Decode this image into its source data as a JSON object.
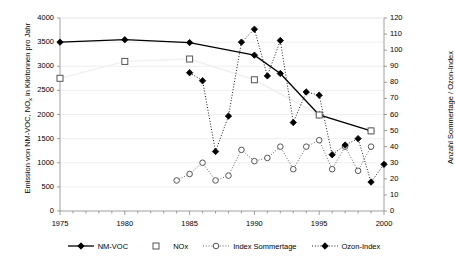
{
  "chart_data": {
    "type": "line",
    "title": "",
    "xlabel": "",
    "ylabel": "Emission von NM-VOC, NOx in Kilotonnen pro Jahr",
    "ylabel_right": "Anzahl Sommertage / Ozon-Index",
    "xlim": [
      1975,
      2000
    ],
    "ylim": [
      0,
      4000
    ],
    "ylim_right": [
      0,
      120
    ],
    "xticks": [
      1975,
      1980,
      1985,
      1990,
      1995,
      2000
    ],
    "xtick_labels": [
      "1975",
      "1980",
      "1985",
      "1990",
      "1995",
      "2000"
    ],
    "xtick_minor_step": 1,
    "yticks": [
      0,
      500,
      1000,
      1500,
      2000,
      2500,
      3000,
      3500,
      4000
    ],
    "ytick_labels": [
      "0",
      "500",
      "1000",
      "1500",
      "2000",
      "2500",
      "3000",
      "3500",
      "4000"
    ],
    "yticks_right": [
      0,
      10,
      20,
      30,
      40,
      50,
      60,
      70,
      80,
      90,
      100,
      110,
      120
    ],
    "ytick_labels_right": [
      "0",
      "10",
      "20",
      "30",
      "40",
      "50",
      "60",
      "70",
      "80",
      "90",
      "100",
      "110",
      "120"
    ],
    "grid": true,
    "legend_position": "bottom",
    "series": [
      {
        "name": "NM-VOC",
        "axis": "left",
        "marker": "filled-diamond",
        "line": "solid",
        "color": "#000000",
        "x": [
          1975,
          1980,
          1985,
          1990,
          1992,
          1995,
          1999
        ],
        "values": [
          3500,
          3550,
          3490,
          3230,
          2850,
          1990,
          1660
        ]
      },
      {
        "name": "NOx",
        "axis": "left",
        "marker": "open-square",
        "line": "none",
        "color": "#000000",
        "x": [
          1975,
          1980,
          1985,
          1990,
          1995,
          1999
        ],
        "values": [
          2750,
          3100,
          3150,
          2720,
          1990,
          1660
        ]
      },
      {
        "name": "Index Sommertage",
        "axis": "right",
        "marker": "open-circle",
        "line": "dotted",
        "color": "#555555",
        "x": [
          1984,
          1985,
          1986,
          1987,
          1988,
          1989,
          1990,
          1991,
          1992,
          1993,
          1994,
          1995,
          1996,
          1997,
          1998,
          1999
        ],
        "values": [
          19,
          23,
          30,
          19,
          22,
          38,
          31,
          33,
          40,
          26,
          40,
          44,
          26,
          40,
          25,
          40
        ]
      },
      {
        "name": "Ozon-Index",
        "axis": "right",
        "marker": "filled-diamond",
        "line": "dotted",
        "color": "#000000",
        "x": [
          1985,
          1986,
          1987,
          1988,
          1989,
          1990,
          1991,
          1992,
          1993,
          1994,
          1995,
          1996,
          1997,
          1998,
          1999,
          2000
        ],
        "values": [
          86,
          81,
          37,
          59,
          105,
          113,
          84,
          106,
          55,
          74,
          72,
          35,
          41,
          45,
          18,
          29
        ]
      }
    ]
  },
  "legend": {
    "items": [
      {
        "label": "NM-VOC",
        "key": "solid-line-filled-diamond"
      },
      {
        "label": "NOx",
        "key": "open-square"
      },
      {
        "label": "Index Sommertage",
        "key": "dotted-line-open-circle"
      },
      {
        "label": "Ozon-Index",
        "key": "dotted-line-filled-diamond"
      }
    ]
  },
  "axes": {
    "left_title_pre": "Emission von NM-VOC, NO",
    "left_title_sub": "x",
    "left_title_post": " in Kilotonnen pro Jahr",
    "right_title": "Anzahl Sommertage / Ozon-Index"
  }
}
